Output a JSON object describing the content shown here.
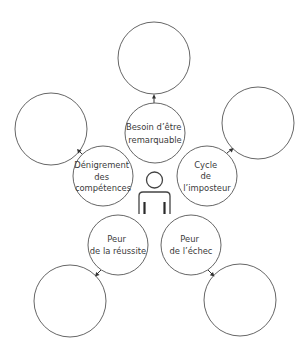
{
  "diagram": {
    "center": {
      "icon": "person-icon",
      "x": 154,
      "y": 192
    },
    "nodes": [
      {
        "id": "besoin",
        "label_lines": [
          "Besoin d’être",
          "remarquable"
        ],
        "inner": {
          "cx": 155,
          "cy": 133,
          "r": 30
        },
        "outer": {
          "cx": 154,
          "cy": 58,
          "r": 36
        }
      },
      {
        "id": "denigrement",
        "label_lines": [
          "Dénigrement",
          "des",
          "compétences"
        ],
        "inner": {
          "cx": 103,
          "cy": 176,
          "r": 30
        },
        "outer": {
          "cx": 51,
          "cy": 129,
          "r": 36
        }
      },
      {
        "id": "cycle",
        "label_lines": [
          "Cycle",
          "de",
          "l’imposteur"
        ],
        "inner": {
          "cx": 207,
          "cy": 176,
          "r": 30
        },
        "outer": {
          "cx": 258,
          "cy": 123,
          "r": 36
        }
      },
      {
        "id": "reussite",
        "label_lines": [
          "Peur",
          "de la réussite"
        ],
        "inner": {
          "cx": 118,
          "cy": 245,
          "r": 30
        },
        "outer": {
          "cx": 70,
          "cy": 301,
          "r": 36
        }
      },
      {
        "id": "echec",
        "label_lines": [
          "Peur",
          "de l’échec"
        ],
        "inner": {
          "cx": 191,
          "cy": 245,
          "r": 30
        },
        "outer": {
          "cx": 240,
          "cy": 300,
          "r": 36
        }
      }
    ],
    "colors": {
      "stroke": "#555555",
      "text": "#3a3a3a",
      "background": "#ffffff"
    }
  }
}
